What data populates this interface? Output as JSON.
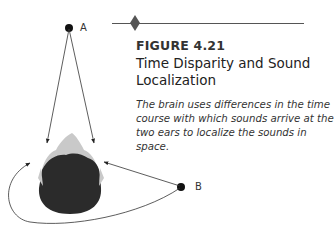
{
  "figure": {
    "label": "FIGURE 4.21",
    "title": "Time Disparity and Sound Localization",
    "caption": "The brain uses differences in the time course with which sounds arrive at the two ears to localize the sounds in space."
  },
  "diagram": {
    "source_a_label": "A",
    "source_b_label": "B",
    "colors": {
      "hair": "#2b2b2b",
      "face": "#c8c8c8",
      "line": "#333333",
      "rule": "#555555"
    }
  }
}
